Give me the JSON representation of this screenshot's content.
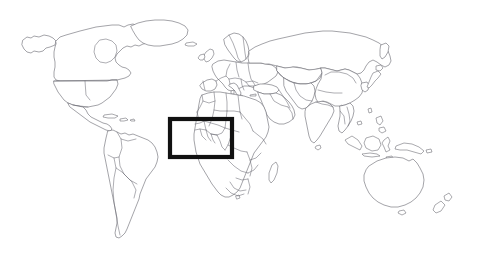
{
  "figure": {
    "type": "world-map-outline",
    "title": "",
    "caption": "",
    "background_color": "#ffffff",
    "outline_color": "#6b6b73",
    "projection_note": "equirectangular-style world political outline"
  },
  "map": {
    "name": "world-political-outline-map",
    "style": "line-art outline, no fills, no labels",
    "stroke_color": "#6b6b73",
    "stroke_width_px": 0.6,
    "has_country_borders": true,
    "has_labels": false,
    "has_graticule": false,
    "continents": [
      {
        "id": "north-america",
        "label": "North America"
      },
      {
        "id": "greenland",
        "label": "Greenland"
      },
      {
        "id": "south-america",
        "label": "South America"
      },
      {
        "id": "europe",
        "label": "Europe"
      },
      {
        "id": "africa",
        "label": "Africa"
      },
      {
        "id": "asia",
        "label": "Asia"
      },
      {
        "id": "southeast-asia-islands",
        "label": "Southeast Asian Archipelago"
      },
      {
        "id": "australia",
        "label": "Australia"
      },
      {
        "id": "new-zealand",
        "label": "New Zealand"
      },
      {
        "id": "madagascar",
        "label": "Madagascar"
      },
      {
        "id": "japan",
        "label": "Japan"
      },
      {
        "id": "british-isles",
        "label": "British Isles"
      }
    ]
  },
  "highlight": {
    "name": "region-highlight-box",
    "shape": "rectangle",
    "color": "#111111",
    "stroke_width_px": 4,
    "region_label": "West Africa",
    "x": 168,
    "y": 117,
    "width": 66,
    "height": 42
  }
}
